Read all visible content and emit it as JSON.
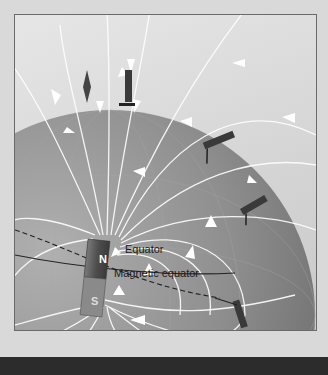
{
  "diagram": {
    "labels": {
      "equator": "Equator",
      "magnetic_equator": "Magnetic equator"
    },
    "magnet": {
      "north_pole": "N",
      "south_pole": "S"
    },
    "elements": [
      "earth-globe",
      "bar-magnet",
      "field-lines-with-arrows",
      "compass-needles",
      "geographic-equator-line",
      "magnetic-equator-dashed-line"
    ],
    "colors": {
      "background": "#d9d9d9",
      "globe": "#8f8f8f",
      "field_lines": "#ffffff",
      "magnet": "#5a5a5a",
      "text": "#1a1a1a",
      "bottom_band": "#2c2c2c"
    }
  }
}
